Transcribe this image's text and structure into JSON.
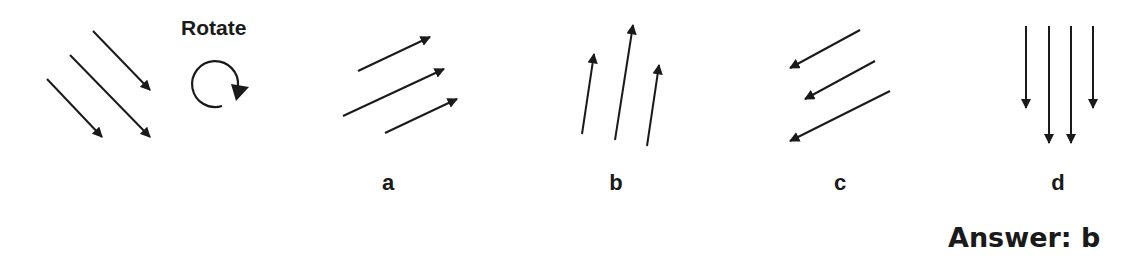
{
  "question": {
    "instruction": "Rotate",
    "instruction_icon": "rotate-clockwise-icon",
    "stimulus": {
      "description": "three parallel arrows pointing down-right",
      "arrows": [
        {
          "x1": 93,
          "y1": 31,
          "x2": 150,
          "y2": 90
        },
        {
          "x1": 70,
          "y1": 55,
          "x2": 150,
          "y2": 137
        },
        {
          "x1": 47,
          "y1": 79,
          "x2": 102,
          "y2": 137
        }
      ]
    },
    "options": [
      {
        "label": "a",
        "label_x": 373,
        "arrows": [
          {
            "x1": 358,
            "y1": 71,
            "x2": 430,
            "y2": 37
          },
          {
            "x1": 343,
            "y1": 116,
            "x2": 444,
            "y2": 69
          },
          {
            "x1": 385,
            "y1": 133,
            "x2": 457,
            "y2": 99
          }
        ]
      },
      {
        "label": "b",
        "label_x": 601,
        "arrows": [
          {
            "x1": 582,
            "y1": 134,
            "x2": 594,
            "y2": 54
          },
          {
            "x1": 615,
            "y1": 140,
            "x2": 633,
            "y2": 25
          },
          {
            "x1": 647,
            "y1": 146,
            "x2": 659,
            "y2": 65
          }
        ]
      },
      {
        "label": "c",
        "label_x": 825,
        "arrows": [
          {
            "x1": 860,
            "y1": 30,
            "x2": 790,
            "y2": 68
          },
          {
            "x1": 875,
            "y1": 61,
            "x2": 805,
            "y2": 99
          },
          {
            "x1": 890,
            "y1": 91,
            "x2": 790,
            "y2": 141
          }
        ]
      },
      {
        "label": "d",
        "label_x": 1043,
        "arrows": [
          {
            "x1": 1026,
            "y1": 26,
            "x2": 1026,
            "y2": 108
          },
          {
            "x1": 1049,
            "y1": 26,
            "x2": 1049,
            "y2": 143
          },
          {
            "x1": 1071,
            "y1": 26,
            "x2": 1071,
            "y2": 143
          },
          {
            "x1": 1093,
            "y1": 26,
            "x2": 1093,
            "y2": 108
          }
        ]
      }
    ],
    "answer": "Answer: b"
  },
  "colors": {
    "ink": "#1a1a1a",
    "background": "#ffffff"
  }
}
